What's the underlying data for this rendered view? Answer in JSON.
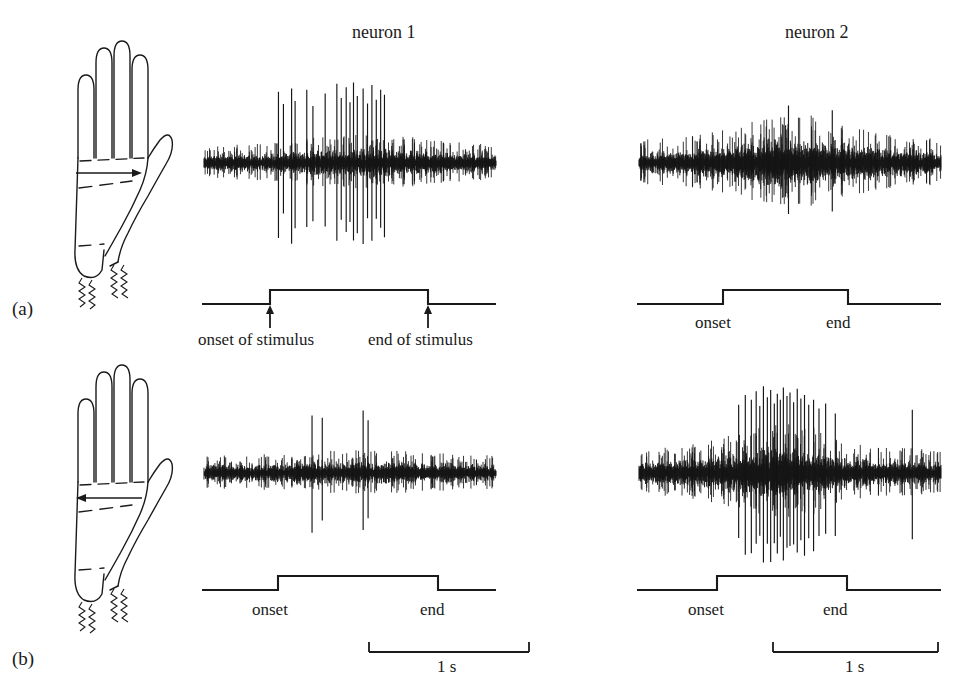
{
  "figure": {
    "background": "#ffffff",
    "ink": "#1a1a1a",
    "width": 976,
    "height": 697
  },
  "columns": [
    {
      "title": "neuron 1",
      "x": 352,
      "y": 22
    },
    {
      "title": "neuron 2",
      "x": 785,
      "y": 22
    }
  ],
  "panels": [
    {
      "id": "a",
      "label": "(a)",
      "label_x": 12,
      "label_y": 300,
      "hand": {
        "name": "hand-palm-diagram",
        "arrow_direction": "right",
        "arrow_label": "stimulus-direction-arrow"
      },
      "traces": [
        {
          "neuron": "neuron 1",
          "name": "spike-trace-neuron1-panel-a"
        },
        {
          "neuron": "neuron 2",
          "name": "spike-trace-neuron2-panel-a"
        }
      ],
      "stimulus_marks": [
        {
          "onset_label": "onset of stimulus",
          "end_label": "end of stimulus",
          "arrows": true
        },
        {
          "onset_label": "onset",
          "end_label": "end",
          "arrows": false
        }
      ]
    },
    {
      "id": "b",
      "label": "(b)",
      "label_x": 12,
      "label_y": 650,
      "hand": {
        "name": "hand-palm-diagram",
        "arrow_direction": "left",
        "arrow_label": "stimulus-direction-arrow"
      },
      "traces": [
        {
          "neuron": "neuron 1",
          "name": "spike-trace-neuron1-panel-b"
        },
        {
          "neuron": "neuron 2",
          "name": "spike-trace-neuron2-panel-b"
        }
      ],
      "stimulus_marks": [
        {
          "onset_label": "onset",
          "end_label": "end",
          "arrows": false
        },
        {
          "onset_label": "onset",
          "end_label": "end",
          "arrows": false
        }
      ]
    }
  ],
  "labels": {
    "onset_of_stimulus": "onset of stimulus",
    "end_of_stimulus": "end of stimulus",
    "onset": "onset",
    "end": "end",
    "scale_1s": "1 s",
    "panel_a": "(a)",
    "panel_b": "(b)",
    "neuron1": "neuron 1",
    "neuron2": "neuron 2"
  },
  "chart_data": {
    "type": "line",
    "xlabel": "time",
    "ylabel": "extracellular potential",
    "scale_bar": {
      "length_label": "1 s",
      "seconds": 1
    },
    "grid": false,
    "legend": null,
    "panels": [
      {
        "panel": "a",
        "stimulus_direction": "rightward sweep across palm",
        "recordings": [
          {
            "neuron": "neuron 1",
            "baseline_amplitude": 14,
            "response": "strong burst of large-amplitude spikes beginning at stimulus onset and persisting through the first half of the stimulus",
            "n_large_spikes": 19,
            "spike_times_norm": [
              0.255,
              0.272,
              0.3,
              0.312,
              0.352,
              0.373,
              0.415,
              0.455,
              0.47,
              0.487,
              0.5,
              0.512,
              0.525,
              0.545,
              0.56,
              0.575,
              0.59,
              0.605,
              0.618
            ],
            "spike_amplitudes": [
              115,
              95,
              120,
              100,
              118,
              92,
              112,
              128,
              105,
              122,
              98,
              130,
              108,
              120,
              96,
              126,
              102,
              118,
              110
            ],
            "stimulus": {
              "onset_norm": 0.24,
              "end_norm": 0.77,
              "onset_label": "onset of stimulus",
              "end_label": "end of stimulus",
              "arrows": true
            }
          },
          {
            "neuron": "neuron 2",
            "baseline_amplitude": 18,
            "response": "no directional response; only two isolated large spikes during the stimulus",
            "n_large_spikes": 2,
            "spike_times_norm": [
              0.495,
              0.64
            ],
            "spike_amplitudes": [
              96,
              88
            ],
            "stimulus": {
              "onset_norm": 0.42,
              "end_norm": 0.77,
              "onset_label": "onset",
              "end_label": "end",
              "arrows": false
            }
          }
        ]
      },
      {
        "panel": "b",
        "stimulus_direction": "leftward sweep across palm",
        "recordings": [
          {
            "neuron": "neuron 1",
            "baseline_amplitude": 14,
            "response": "no directional response; four isolated large spikes",
            "n_large_spikes": 4,
            "spike_times_norm": [
              0.37,
              0.405,
              0.545,
              0.562
            ],
            "spike_amplitudes": [
              96,
              92,
              104,
              88
            ],
            "stimulus": {
              "onset_norm": 0.34,
              "end_norm": 0.79,
              "onset_label": "onset",
              "end_label": "end",
              "arrows": false
            }
          },
          {
            "neuron": "neuron 2",
            "baseline_amplitude": 18,
            "response": "strong burst of large-amplitude spikes spanning the stimulus period",
            "n_large_spikes": 24,
            "spike_times_norm": [
              0.33,
              0.352,
              0.372,
              0.388,
              0.4,
              0.412,
              0.425,
              0.436,
              0.448,
              0.458,
              0.468,
              0.478,
              0.49,
              0.5,
              0.512,
              0.524,
              0.536,
              0.548,
              0.562,
              0.578,
              0.596,
              0.618,
              0.65,
              0.905
            ],
            "spike_amplitudes": [
              110,
              126,
              118,
              132,
              108,
              140,
              122,
              134,
              112,
              128,
              118,
              138,
              124,
              130,
              114,
              136,
              120,
              126,
              110,
              118,
              104,
              112,
              96,
              102
            ],
            "stimulus": {
              "onset_norm": 0.32,
              "end_norm": 0.72,
              "onset_label": "onset",
              "end_label": "end",
              "arrows": false
            }
          }
        ]
      }
    ]
  }
}
